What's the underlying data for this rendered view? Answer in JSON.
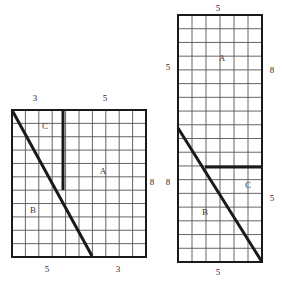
{
  "figure_data": {
    "type": "diagram",
    "description": "Two gridded rectangle dissection diagrams with labelled regions A, B, C and edge dimension numbers",
    "background_color": "#ffffff",
    "line_color": "#1a1a1a",
    "grid_color": "#555555",
    "figures": [
      {
        "id": "left-figure",
        "x": 12,
        "y": 110,
        "width": 134,
        "height": 147,
        "cols": 10,
        "rows": 11,
        "cell_w": 13.4,
        "cell_h": 13.36,
        "heavy_lines": [
          {
            "name": "vertical-divider",
            "x1": 63,
            "y1": 110,
            "x2": 63,
            "y2": 190,
            "width": 3
          },
          {
            "name": "diagonal-cut",
            "x1": 12,
            "y1": 110,
            "x2": 92,
            "y2": 256,
            "width": 3
          }
        ],
        "edge_labels": [
          {
            "name": "top-label-3",
            "text": "3",
            "x": 35,
            "y": 98
          },
          {
            "name": "top-label-5",
            "text": "5",
            "x": 105,
            "y": 98
          },
          {
            "name": "right-label-8",
            "text": "8",
            "x": 152,
            "y": 182
          },
          {
            "name": "bottom-label-5",
            "text": "5",
            "x": 47,
            "y": 269
          },
          {
            "name": "bottom-label-3",
            "text": "3",
            "x": 118,
            "y": 269
          }
        ],
        "region_labels": [
          {
            "name": "region-c",
            "text": "C",
            "x": 45,
            "y": 126
          },
          {
            "name": "region-a",
            "text": "A",
            "x": 103,
            "y": 171
          },
          {
            "name": "region-b",
            "text": "B",
            "x": 33,
            "y": 210
          }
        ]
      },
      {
        "id": "right-figure",
        "x": 178,
        "y": 15,
        "width": 84,
        "height": 247,
        "cols": 6,
        "rows": 18,
        "cell_w": 14.0,
        "cell_h": 13.72,
        "heavy_lines": [
          {
            "name": "horizontal-divider",
            "x1": 205,
            "y1": 167,
            "x2": 262,
            "y2": 167,
            "width": 3
          },
          {
            "name": "diagonal-cut",
            "x1": 178,
            "y1": 128,
            "x2": 262,
            "y2": 262,
            "width": 3
          }
        ],
        "edge_labels": [
          {
            "name": "top-label-5",
            "text": "5",
            "x": 218,
            "y": 8
          },
          {
            "name": "left-label-5",
            "text": "5",
            "x": 168,
            "y": 67
          },
          {
            "name": "left-label-8",
            "text": "8",
            "x": 168,
            "y": 182
          },
          {
            "name": "right-label-8",
            "text": "8",
            "x": 272,
            "y": 70
          },
          {
            "name": "right-label-5",
            "text": "5",
            "x": 272,
            "y": 198
          },
          {
            "name": "bottom-label-5",
            "text": "5",
            "x": 218,
            "y": 272
          }
        ],
        "region_labels": [
          {
            "name": "region-a",
            "text": "A",
            "x": 222,
            "y": 58
          },
          {
            "name": "region-c",
            "text": "C",
            "x": 248,
            "y": 185
          },
          {
            "name": "region-b",
            "text": "B",
            "x": 205,
            "y": 212
          }
        ]
      }
    ]
  }
}
